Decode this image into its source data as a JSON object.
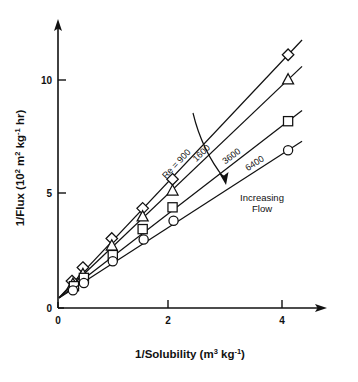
{
  "chart_data": {
    "type": "line",
    "title": "",
    "subtitle": "",
    "xlabel": "1/Solubility (m3 kg-1)",
    "xlabel_parts": {
      "base": "1/Solubility (m",
      "sup1": "3",
      "mid": " kg",
      "sup2": "-1",
      "tail": ")"
    },
    "ylabel": "1/Flux (102 m2 kg-1 hr)",
    "ylabel_parts": {
      "base": "1/Flux (10",
      "sup1": "2",
      "mid": " m",
      "sup2": "2",
      "mid2": " kg",
      "sup3": "-1",
      "tail": " hr)"
    },
    "xlim": [
      0,
      5.1
    ],
    "ylim": [
      0,
      13.2
    ],
    "xticks": [
      0,
      2,
      4
    ],
    "xticklabels": [
      "0",
      "2",
      "4"
    ],
    "yticks": [
      0,
      5,
      10
    ],
    "yticklabels": [
      "0",
      "5",
      "10"
    ],
    "grid": false,
    "legend_position": "inline-along-lines",
    "axis_arrows": true,
    "marker_fill": "#ffffff",
    "line_color": "#111111",
    "series": [
      {
        "name": "Re = 900",
        "label_text": "900",
        "label_prefix": "Re = ",
        "marker": "diamond",
        "x": [
          0.28,
          0.5,
          1.08,
          1.7,
          2.3,
          4.62
        ],
        "y": [
          1.3,
          1.95,
          3.35,
          4.8,
          6.2,
          12.2
        ]
      },
      {
        "name": "1600",
        "label_text": "1600",
        "label_prefix": "",
        "marker": "triangle",
        "x": [
          0.3,
          0.5,
          1.08,
          1.7,
          2.3,
          4.62
        ],
        "y": [
          1.15,
          1.62,
          3.0,
          4.4,
          5.65,
          11.0
        ]
      },
      {
        "name": "3600",
        "label_text": "3600",
        "label_prefix": "",
        "marker": "square",
        "x": [
          0.32,
          0.52,
          1.1,
          1.7,
          2.3,
          4.62
        ],
        "y": [
          1.05,
          1.45,
          2.55,
          3.8,
          4.85,
          9.0
        ]
      },
      {
        "name": "6400",
        "label_text": "6400",
        "label_prefix": "",
        "marker": "circle",
        "x": [
          0.3,
          0.52,
          1.1,
          1.72,
          2.32,
          4.62
        ],
        "y": [
          0.85,
          1.2,
          2.25,
          3.3,
          4.2,
          7.6
        ]
      }
    ],
    "annotations": [
      {
        "name": "increasing-flow",
        "line1": "Increasing",
        "line2": "Flow"
      }
    ]
  }
}
